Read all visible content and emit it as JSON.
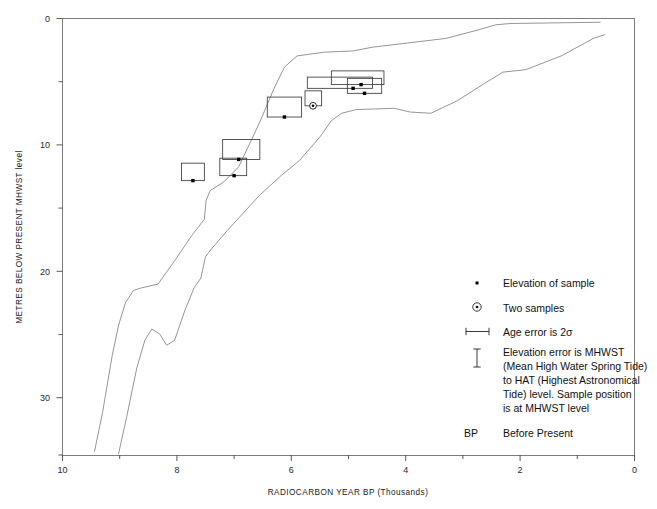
{
  "chart_data": {
    "type": "scatter",
    "title": "",
    "xlabel": "RADIOCARBON YEAR BP (Thousands)",
    "ylabel": "METRES BELOW PRESENT MHWST level",
    "xlim": [
      10,
      0
    ],
    "ylim": [
      35,
      0
    ],
    "x_reversed": true,
    "y_reversed": true,
    "grid": false,
    "x_ticks": [
      10,
      8,
      6,
      4,
      2,
      0
    ],
    "x_tick_labels": [
      "10",
      "8",
      "6",
      "4",
      "2",
      "0"
    ],
    "x_minor_ticks": [
      9,
      7,
      5,
      3,
      1
    ],
    "y_ticks": [
      0,
      10,
      20,
      30
    ],
    "y_tick_labels": [
      "0",
      "10",
      "20",
      "30"
    ],
    "y_minor_ticks": [
      5,
      15,
      25,
      35
    ],
    "legend_position": "inside-lower-right",
    "series": [
      {
        "name": "Sample elevations with age and elevation error boxes",
        "marker": "point-with-error-box",
        "points": [
          {
            "x": 7.72,
            "y": 13.0,
            "x_err_low": 7.92,
            "x_err_high": 7.52,
            "y_err_top": 11.6,
            "y_err_bottom": 13.0,
            "two_samples": false
          },
          {
            "x": 7.0,
            "y": 12.6,
            "x_err_low": 7.25,
            "x_err_high": 6.78,
            "y_err_top": 11.2,
            "y_err_bottom": 12.6,
            "two_samples": false
          },
          {
            "x": 6.92,
            "y": 11.3,
            "x_err_low": 7.2,
            "x_err_high": 6.55,
            "y_err_top": 9.7,
            "y_err_bottom": 11.3,
            "two_samples": false
          },
          {
            "x": 6.12,
            "y": 7.9,
            "x_err_low": 6.42,
            "x_err_high": 5.82,
            "y_err_top": 6.3,
            "y_err_bottom": 7.9,
            "two_samples": false
          },
          {
            "x": 5.62,
            "y": 7.0,
            "x_err_low": 5.76,
            "x_err_high": 5.47,
            "y_err_top": 5.8,
            "y_err_bottom": 7.0,
            "two_samples": true
          },
          {
            "x": 4.92,
            "y": 5.6,
            "x_err_low": 5.72,
            "x_err_high": 4.58,
            "y_err_top": 4.7,
            "y_err_bottom": 5.6,
            "two_samples": false
          },
          {
            "x": 4.78,
            "y": 5.3,
            "x_err_low": 5.3,
            "x_err_high": 4.38,
            "y_err_top": 4.2,
            "y_err_bottom": 5.3,
            "two_samples": false
          },
          {
            "x": 4.72,
            "y": 6.0,
            "x_err_low": 5.02,
            "x_err_high": 4.42,
            "y_err_top": 4.8,
            "y_err_bottom": 6.0,
            "two_samples": false
          }
        ]
      },
      {
        "name": "Upper sea-level envelope curve",
        "type": "line",
        "points": [
          {
            "x": 9.44,
            "y": 34.7
          },
          {
            "x": 9.3,
            "y": 31.6
          },
          {
            "x": 9.13,
            "y": 27.0
          },
          {
            "x": 9.02,
            "y": 24.6
          },
          {
            "x": 8.9,
            "y": 22.8
          },
          {
            "x": 8.76,
            "y": 21.8
          },
          {
            "x": 8.62,
            "y": 21.6
          },
          {
            "x": 8.33,
            "y": 21.3
          },
          {
            "x": 8.02,
            "y": 19.3
          },
          {
            "x": 7.74,
            "y": 17.4
          },
          {
            "x": 7.52,
            "y": 16.1
          },
          {
            "x": 7.49,
            "y": 14.6
          },
          {
            "x": 7.42,
            "y": 13.8
          },
          {
            "x": 7.18,
            "y": 13.1
          },
          {
            "x": 6.92,
            "y": 11.9
          },
          {
            "x": 6.56,
            "y": 8.4
          },
          {
            "x": 6.3,
            "y": 5.6
          },
          {
            "x": 6.12,
            "y": 3.9
          },
          {
            "x": 5.9,
            "y": 3.0
          },
          {
            "x": 5.42,
            "y": 2.7
          },
          {
            "x": 4.92,
            "y": 2.6
          },
          {
            "x": 4.58,
            "y": 2.3
          },
          {
            "x": 3.3,
            "y": 1.6
          },
          {
            "x": 2.72,
            "y": 0.9
          },
          {
            "x": 2.42,
            "y": 0.5
          },
          {
            "x": 2.16,
            "y": 0.4
          },
          {
            "x": 0.6,
            "y": 0.3
          }
        ]
      },
      {
        "name": "Lower sea-level envelope curve",
        "type": "line",
        "points": [
          {
            "x": 9.02,
            "y": 34.9
          },
          {
            "x": 8.88,
            "y": 32.0
          },
          {
            "x": 8.7,
            "y": 28.0
          },
          {
            "x": 8.56,
            "y": 25.8
          },
          {
            "x": 8.44,
            "y": 24.9
          },
          {
            "x": 8.3,
            "y": 25.3
          },
          {
            "x": 8.18,
            "y": 26.2
          },
          {
            "x": 8.04,
            "y": 25.8
          },
          {
            "x": 7.86,
            "y": 23.4
          },
          {
            "x": 7.7,
            "y": 21.6
          },
          {
            "x": 7.58,
            "y": 20.8
          },
          {
            "x": 7.5,
            "y": 19.1
          },
          {
            "x": 7.4,
            "y": 18.5
          },
          {
            "x": 7.12,
            "y": 17.0
          },
          {
            "x": 6.56,
            "y": 14.2
          },
          {
            "x": 6.18,
            "y": 12.6
          },
          {
            "x": 5.86,
            "y": 11.4
          },
          {
            "x": 5.5,
            "y": 9.5
          },
          {
            "x": 5.3,
            "y": 8.2
          },
          {
            "x": 5.12,
            "y": 7.6
          },
          {
            "x": 4.86,
            "y": 7.3
          },
          {
            "x": 4.2,
            "y": 7.2
          },
          {
            "x": 3.92,
            "y": 7.5
          },
          {
            "x": 3.56,
            "y": 7.6
          },
          {
            "x": 3.1,
            "y": 6.6
          },
          {
            "x": 2.62,
            "y": 5.2
          },
          {
            "x": 2.3,
            "y": 4.3
          },
          {
            "x": 1.9,
            "y": 4.1
          },
          {
            "x": 1.28,
            "y": 3.0
          },
          {
            "x": 0.72,
            "y": 1.6
          },
          {
            "x": 0.52,
            "y": 1.3
          }
        ]
      }
    ],
    "legend_entries": [
      {
        "marker": "dot",
        "label": "Elevation of sample"
      },
      {
        "marker": "circle-dot",
        "label": "Two samples"
      },
      {
        "marker": "horizontal-error-bar",
        "label": "Age error is 2σ"
      },
      {
        "marker": "vertical-error-bar",
        "label": "Elevation error is MHWST"
      },
      {
        "marker": "none",
        "label": "(Mean High Water Spring Tide)"
      },
      {
        "marker": "none",
        "label": "to HAT (Highest Astronomical"
      },
      {
        "marker": "none",
        "label": "Tide) level. Sample position"
      },
      {
        "marker": "none",
        "label": "is at MHWST level"
      },
      {
        "marker": "text-BP",
        "label": "Before Present",
        "prefix": "BP"
      }
    ]
  },
  "axes": {
    "x_title": "RADIOCARBON YEAR BP (Thousands)",
    "y_title": "METRES BELOW PRESENT MHWST level",
    "x_tick_labels": [
      "10",
      "8",
      "6",
      "4",
      "2",
      "0"
    ],
    "y_tick_labels": [
      "0",
      "10",
      "20",
      "30"
    ]
  },
  "legend": {
    "elevation_of_sample": "Elevation of sample",
    "two_samples": "Two samples",
    "age_error": "Age error is 2σ",
    "elev_error_l1": "Elevation error is MHWST",
    "elev_error_l2": "(Mean High Water Spring Tide)",
    "elev_error_l3": "to HAT (Highest Astronomical",
    "elev_error_l4": "Tide) level. Sample position",
    "elev_error_l5": "is at MHWST level",
    "bp_abbrev": "BP",
    "bp_meaning": "Before Present"
  },
  "colors": {
    "frame": "#7d7d7d",
    "curve": "#8a8a8a",
    "errbox": "#3a3a3a",
    "point": "#000000",
    "text": "#111111",
    "background": "#ffffff"
  }
}
